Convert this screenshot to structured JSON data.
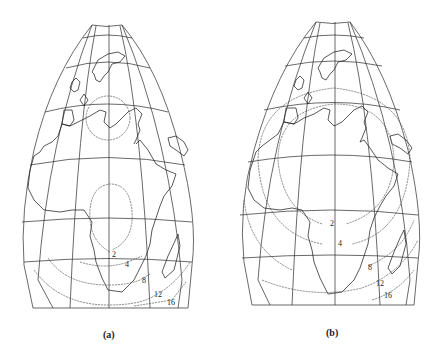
{
  "figure": {
    "panels": [
      {
        "id": "a",
        "caption": "(a)",
        "projection": "oblique map of Europe-Africa with graticule",
        "contour_labels": [
          "2",
          "4",
          "8",
          "12",
          "16"
        ],
        "description": "Isolines centered over the Mediterranean (small circle around Europe/Mediterranean) and southern Africa"
      },
      {
        "id": "b",
        "caption": "(b)",
        "projection": "oblique map of Europe-Africa with graticule",
        "contour_labels": [
          "2",
          "4",
          "8",
          "12",
          "16"
        ],
        "description": "Isolines forming large concentric circles centered over central Africa"
      }
    ]
  },
  "colors": {
    "background": "#ffffff",
    "lines": "#222222"
  }
}
